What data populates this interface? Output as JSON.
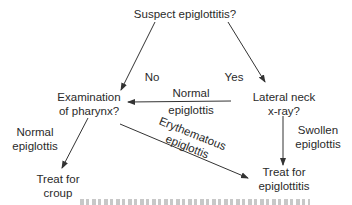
{
  "diagram": {
    "type": "flowchart",
    "nodes": {
      "start": {
        "lines": [
          "Suspect epiglottitis?"
        ]
      },
      "exam": {
        "lines": [
          "Examination",
          "of pharynx?"
        ]
      },
      "xray": {
        "lines": [
          "Lateral neck",
          "x-ray?"
        ]
      },
      "croup": {
        "lines": [
          "Treat for",
          "croup"
        ]
      },
      "epi": {
        "lines": [
          "Treat for",
          "epiglottitis"
        ]
      }
    },
    "edges": {
      "no": {
        "from": "start",
        "to": "exam",
        "label": "No"
      },
      "yes": {
        "from": "start",
        "to": "xray",
        "label": "Yes"
      },
      "xray_normal": {
        "from": "xray",
        "to": "exam",
        "lines": [
          "Normal",
          "epiglottis"
        ]
      },
      "exam_normal": {
        "from": "exam",
        "to": "croup",
        "lines": [
          "Normal",
          "epiglottis"
        ]
      },
      "exam_erythematous": {
        "from": "exam",
        "to": "epi",
        "lines": [
          "Erythematous",
          "epiglottis"
        ]
      },
      "xray_swollen": {
        "from": "xray",
        "to": "epi",
        "lines": [
          "Swollen",
          "epiglottis"
        ]
      }
    },
    "colors": {
      "text": "#2a2a2a",
      "lines": "#333333",
      "background": "#ffffff"
    }
  }
}
